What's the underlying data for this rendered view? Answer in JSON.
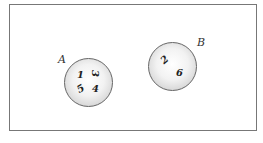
{
  "diagram": {
    "sets": [
      {
        "label": "A",
        "elements": [
          "1",
          "3",
          "5",
          "4"
        ]
      },
      {
        "label": "B",
        "elements": [
          "2",
          "6"
        ]
      }
    ]
  }
}
